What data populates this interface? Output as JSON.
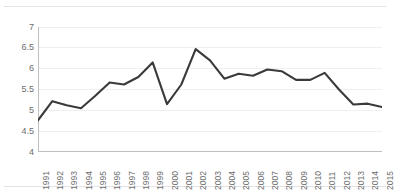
{
  "chart_data": {
    "type": "line",
    "title": "",
    "subtitle": "",
    "xlabel": "",
    "ylabel": "",
    "categories": [
      "1991",
      "1992",
      "1993",
      "1994",
      "1995",
      "1996",
      "1997",
      "1998",
      "1999",
      "2000",
      "2001",
      "2002",
      "2003",
      "2004",
      "2005",
      "2006",
      "2007",
      "2008",
      "2009",
      "2010",
      "2011",
      "2012",
      "2013",
      "2014",
      "2015"
    ],
    "values": [
      4.76,
      5.22,
      5.12,
      5.05,
      5.35,
      5.67,
      5.62,
      5.8,
      6.15,
      5.15,
      5.62,
      6.47,
      6.2,
      5.76,
      5.88,
      5.83,
      5.98,
      5.94,
      5.73,
      5.73,
      5.9,
      5.5,
      5.14,
      5.16,
      5.08
    ],
    "series": [
      {
        "name": "series-1",
        "color": "#3a3a3a",
        "values": [
          4.76,
          5.22,
          5.12,
          5.05,
          5.35,
          5.67,
          5.62,
          5.8,
          6.15,
          5.15,
          5.62,
          6.47,
          6.2,
          5.76,
          5.88,
          5.83,
          5.98,
          5.94,
          5.73,
          5.73,
          5.9,
          5.5,
          5.14,
          5.16,
          5.08
        ]
      }
    ],
    "ylim": [
      4,
      7
    ],
    "yticks": [
      4,
      4.5,
      5,
      5.5,
      6,
      6.5,
      7
    ],
    "ytick_labels": [
      "4",
      "4.5",
      "5",
      "5.5",
      "6",
      "6.5",
      "7"
    ],
    "xtick_labels": [
      "1991",
      "1992",
      "1993",
      "1994",
      "1995",
      "1996",
      "1997",
      "1998",
      "1999",
      "2000",
      "2001",
      "2002",
      "2003",
      "2004",
      "2005",
      "2006",
      "2007",
      "2008",
      "2009",
      "2010",
      "2011",
      "2012",
      "2013",
      "2014",
      "2015"
    ],
    "grid": {
      "horizontal": true,
      "vertical": false,
      "color": "#efeff1"
    },
    "legend": {
      "visible": false,
      "position": "none",
      "entries": []
    },
    "axis": {
      "y_axis_line_color": "#bfbfbf",
      "x_axis_line_color": "#bfbfbf",
      "tick_color": "#bfbfbf",
      "x_label_rotation": -90
    },
    "line": {
      "color": "#3a3a3a",
      "width": 2.1,
      "markers": false
    },
    "background": "#ffffff"
  },
  "page": {
    "rule_color": "#e3e3e6"
  }
}
